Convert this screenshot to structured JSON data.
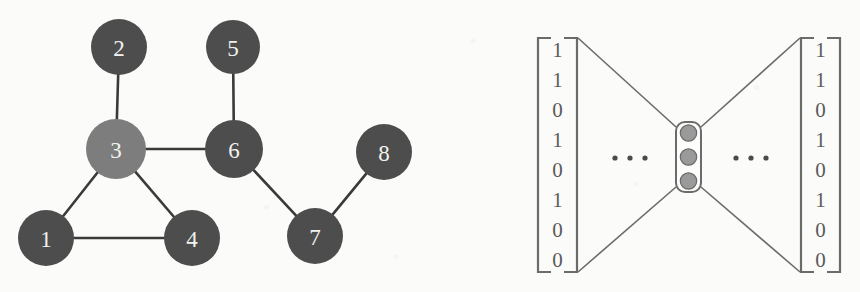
{
  "figure": {
    "background_color": "#fbfbf9"
  },
  "graph": {
    "name": "example-graph",
    "node_radius": 28,
    "node_color": "#4d4d4d",
    "highlight_color": "#7d7d7d",
    "edge_color": "#3a3a3a",
    "label_color": "#f2f2ef",
    "nodes": [
      {
        "id": "1",
        "label": "1",
        "x": 46,
        "y": 238,
        "r": 28,
        "highlighted": false
      },
      {
        "id": "2",
        "label": "2",
        "x": 119,
        "y": 47,
        "r": 28,
        "highlighted": false
      },
      {
        "id": "3",
        "label": "3",
        "x": 116,
        "y": 149,
        "r": 30,
        "highlighted": true
      },
      {
        "id": "4",
        "label": "4",
        "x": 192,
        "y": 238,
        "r": 28,
        "highlighted": false
      },
      {
        "id": "5",
        "label": "5",
        "x": 233,
        "y": 47,
        "r": 27,
        "highlighted": false
      },
      {
        "id": "6",
        "label": "6",
        "x": 234,
        "y": 149,
        "r": 29,
        "highlighted": false
      },
      {
        "id": "7",
        "label": "7",
        "x": 315,
        "y": 236,
        "r": 28,
        "highlighted": false
      },
      {
        "id": "8",
        "label": "8",
        "x": 384,
        "y": 152,
        "r": 28,
        "highlighted": false
      }
    ],
    "edges": [
      {
        "from": "2",
        "to": "3"
      },
      {
        "from": "3",
        "to": "1"
      },
      {
        "from": "3",
        "to": "4"
      },
      {
        "from": "3",
        "to": "6"
      },
      {
        "from": "1",
        "to": "4"
      },
      {
        "from": "5",
        "to": "6"
      },
      {
        "from": "6",
        "to": "7"
      },
      {
        "from": "7",
        "to": "8"
      }
    ]
  },
  "autoencoder": {
    "name": "autoencoder",
    "stroke_color": "#6b6b6b",
    "digit_color": "#5a5a5a",
    "input_vector": {
      "label": "input-vector",
      "values": [
        "1",
        "1",
        "0",
        "1",
        "0",
        "1",
        "0",
        "0"
      ],
      "bracket": {
        "x_left": 538,
        "x_right": 577,
        "y_top": 38,
        "y_bottom": 272
      }
    },
    "output_vector": {
      "label": "output-vector",
      "values": [
        "1",
        "1",
        "0",
        "1",
        "0",
        "1",
        "0",
        "0"
      ],
      "bracket": {
        "x_left": 801,
        "x_right": 840,
        "y_top": 38,
        "y_bottom": 272
      }
    },
    "left_ellipsis": {
      "label": "...",
      "x": 630,
      "y": 158
    },
    "right_ellipsis": {
      "label": "...",
      "x": 751,
      "y": 158
    },
    "bottleneck": {
      "label": "bottleneck-layer",
      "x": 676,
      "y": 122,
      "width": 25,
      "height": 70,
      "unit_color": "#9a9a9a",
      "unit_stroke": "#6b6b6b",
      "units": 3
    }
  }
}
